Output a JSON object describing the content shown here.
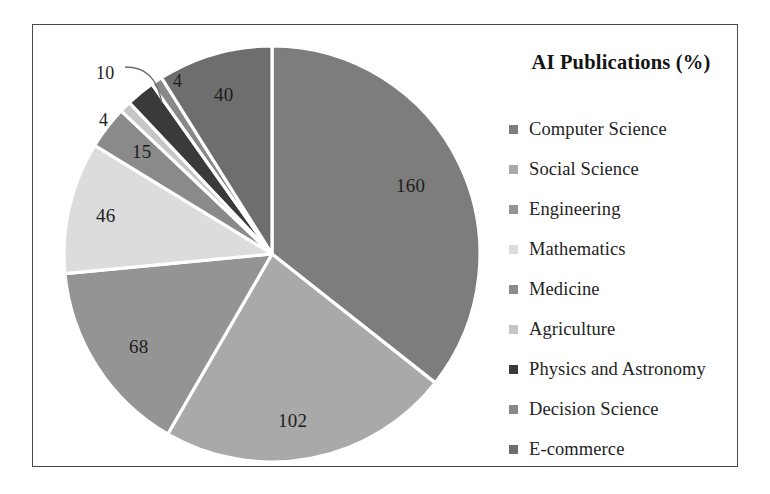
{
  "frame": {
    "border_color": "#4a4a4a",
    "background": "#ffffff"
  },
  "legend": {
    "title": "AI Publications (%)",
    "position": "right",
    "items": [
      {
        "label": "Computer Science",
        "color": "#7d7d7d"
      },
      {
        "label": "Social Science",
        "color": "#a9a9a9"
      },
      {
        "label": "Engineering",
        "color": "#949494"
      },
      {
        "label": "Mathematics",
        "color": "#dcdcdc"
      },
      {
        "label": "Medicine",
        "color": "#8a8a8a"
      },
      {
        "label": "Agriculture",
        "color": "#c6c6c6"
      },
      {
        "label": "Physics and Astronomy",
        "color": "#3a3a3a"
      },
      {
        "label": "Decision Science",
        "color": "#888888"
      },
      {
        "label": "E-commerce",
        "color": "#6e6e6e"
      }
    ]
  },
  "chart_data": {
    "type": "pie",
    "title": "AI Publications (%)",
    "xlabel": "",
    "ylabel": "",
    "total": 449,
    "start_angle_deg": 0,
    "direction": "clockwise",
    "separator_color": "#ffffff",
    "categories": [
      "Computer Science",
      "Social Science",
      "Engineering",
      "Mathematics",
      "Medicine",
      "Agriculture",
      "Physics and Astronomy",
      "Decision Science",
      "E-commerce"
    ],
    "values": [
      160,
      102,
      68,
      46,
      15,
      4,
      10,
      4,
      40
    ],
    "colors": [
      "#7d7d7d",
      "#a9a9a9",
      "#949494",
      "#dcdcdc",
      "#8a8a8a",
      "#c6c6c6",
      "#3a3a3a",
      "#888888",
      "#6e6e6e"
    ],
    "data_labels": [
      "160",
      "102",
      "68",
      "46",
      "15",
      "4",
      "10",
      "4",
      "40"
    ],
    "label_placement": [
      "inside",
      "inside",
      "inside",
      "inside",
      "inside",
      "outside",
      "outside",
      "outside",
      "inside"
    ],
    "leader_lines": [
      "10"
    ],
    "legend_position": "right",
    "grid": false
  },
  "pie_geometry": {
    "center_x": 239,
    "center_y": 229,
    "radius": 208
  },
  "labels": {
    "l160": {
      "text": "160",
      "x": 363,
      "y": 150
    },
    "l102": {
      "text": "102",
      "x": 245,
      "y": 385
    },
    "l68": {
      "text": "68",
      "x": 96,
      "y": 311
    },
    "l46": {
      "text": "46",
      "x": 63,
      "y": 180
    },
    "l15": {
      "text": "15",
      "x": 99,
      "y": 116
    },
    "l4a": {
      "text": "4",
      "x": 66,
      "y": 85
    },
    "l10": {
      "text": "10",
      "x": 63,
      "y": 38
    },
    "l4b": {
      "text": "4",
      "x": 140,
      "y": 46
    },
    "l40": {
      "text": "40",
      "x": 181,
      "y": 59
    }
  }
}
